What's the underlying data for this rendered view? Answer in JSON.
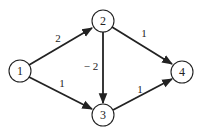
{
  "diagram": {
    "type": "directed-weighted-graph",
    "nodes": [
      {
        "id": "1",
        "label": "1",
        "x": 20,
        "y": 71
      },
      {
        "id": "2",
        "label": "2",
        "x": 103,
        "y": 21
      },
      {
        "id": "3",
        "label": "3",
        "x": 103,
        "y": 115
      },
      {
        "id": "4",
        "label": "4",
        "x": 182,
        "y": 72
      }
    ],
    "edges": [
      {
        "from": "1",
        "to": "2",
        "weight": "2"
      },
      {
        "from": "1",
        "to": "3",
        "weight": "1"
      },
      {
        "from": "2",
        "to": "3",
        "weight": "− 2"
      },
      {
        "from": "2",
        "to": "4",
        "weight": "1"
      },
      {
        "from": "3",
        "to": "4",
        "weight": "1"
      }
    ]
  },
  "colors": {
    "stroke": "#222222",
    "background": "#ffffff"
  }
}
